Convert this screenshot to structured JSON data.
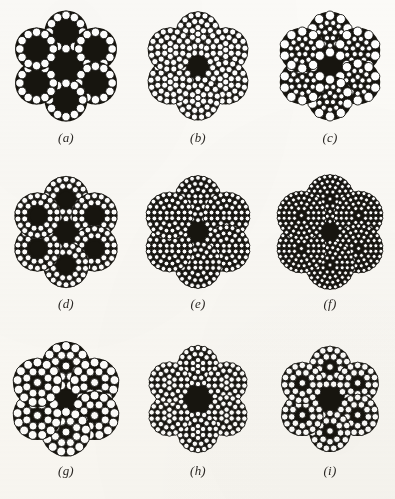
{
  "plate": {
    "background_color": "#fbfaf7",
    "ink_color": "#17150f",
    "wire_outline_color": "#141310",
    "wire_fill_color": "#ffffff",
    "columns": 3,
    "rows": 3,
    "width_px": 395,
    "height_px": 499
  },
  "figures": [
    {
      "id": "fig-a",
      "caption": "(a)",
      "description": "6 x 19 wire rope cross section with independent wire rope core; each strand is a single ring of 12 round wires around a dark core",
      "strand_count": 6,
      "strand_rings": [
        {
          "radius_ratio": 0.76,
          "wire_count": 12,
          "wire_radius": 4.2
        }
      ],
      "strand_core_dark": true,
      "strand_core_radius": 13.0,
      "strand_radius": 22.0,
      "orbit_radius": 34.0,
      "center_dark_radius": 22.0,
      "center_style": "round",
      "center_core_strand": {
        "rings": [
          {
            "radius_ratio": 0.0,
            "wire_count": 0,
            "wire_radius": 0
          }
        ]
      },
      "offset_x": 0,
      "offset_y": 0
    },
    {
      "id": "fig-b",
      "caption": "(b)",
      "description": "6 strand rope, each strand packed with many equal small wires, dark hexagonal core region",
      "strand_count": 6,
      "strand_rings": [
        {
          "radius_ratio": 0.84,
          "wire_count": 17,
          "wire_radius": 3.1
        },
        {
          "radius_ratio": 0.56,
          "wire_count": 12,
          "wire_radius": 3.1
        },
        {
          "radius_ratio": 0.28,
          "wire_count": 6,
          "wire_radius": 3.1
        },
        {
          "radius_ratio": 0.0,
          "wire_count": 1,
          "wire_radius": 3.1
        }
      ],
      "strand_core_dark": false,
      "strand_core_radius": 0,
      "strand_radius": 23.0,
      "orbit_radius": 32.0,
      "center_dark_radius": 26.0,
      "center_style": "hex",
      "offset_x": 0,
      "offset_y": 0
    },
    {
      "id": "fig-c",
      "caption": "(c)",
      "description": "6 strand Seale construction; large outer wires over smaller inner wires, dark star shaped core region",
      "strand_count": 6,
      "strand_rings": [
        {
          "radius_ratio": 0.8,
          "wire_count": 10,
          "wire_radius": 4.6
        },
        {
          "radius_ratio": 0.5,
          "wire_count": 11,
          "wire_radius": 2.6
        },
        {
          "radius_ratio": 0.22,
          "wire_count": 5,
          "wire_radius": 2.6
        }
      ],
      "strand_core_dark": false,
      "strand_core_radius": 0,
      "strand_radius": 23.0,
      "orbit_radius": 32.0,
      "center_dark_radius": 27.0,
      "center_style": "star",
      "offset_x": 0,
      "offset_y": 0
    },
    {
      "id": "fig-d",
      "caption": "(d)",
      "description": "6 strand rope, each strand has two concentric rings of wires around a dark strand core, dark center region",
      "strand_count": 6,
      "strand_rings": [
        {
          "radius_ratio": 0.84,
          "wire_count": 18,
          "wire_radius": 3.0
        },
        {
          "radius_ratio": 0.56,
          "wire_count": 12,
          "wire_radius": 3.0
        }
      ],
      "strand_core_dark": true,
      "strand_core_radius": 7.5,
      "strand_radius": 23.5,
      "orbit_radius": 33.0,
      "center_dark_radius": 23.0,
      "center_style": "round",
      "offset_x": 0,
      "offset_y": 0
    },
    {
      "id": "fig-e",
      "caption": "(e)",
      "description": "6 strand rope with very fine dense wires, large dark hexagonal core region",
      "strand_count": 6,
      "strand_rings": [
        {
          "radius_ratio": 0.88,
          "wire_count": 22,
          "wire_radius": 2.4
        },
        {
          "radius_ratio": 0.64,
          "wire_count": 16,
          "wire_radius": 2.4
        },
        {
          "radius_ratio": 0.4,
          "wire_count": 10,
          "wire_radius": 2.4
        },
        {
          "radius_ratio": 0.16,
          "wire_count": 4,
          "wire_radius": 2.4
        }
      ],
      "strand_core_dark": false,
      "strand_core_radius": 0,
      "strand_radius": 24.0,
      "orbit_radius": 33.0,
      "center_dark_radius": 29.0,
      "center_style": "hex",
      "offset_x": 0,
      "offset_y": 0
    },
    {
      "id": "fig-f",
      "caption": "(f)",
      "description": "6 strand rope with the finest wires of the plate, dark six point star core region",
      "strand_count": 6,
      "strand_rings": [
        {
          "radius_ratio": 0.9,
          "wire_count": 26,
          "wire_radius": 2.0
        },
        {
          "radius_ratio": 0.7,
          "wire_count": 20,
          "wire_radius": 2.0
        },
        {
          "radius_ratio": 0.5,
          "wire_count": 14,
          "wire_radius": 2.0
        },
        {
          "radius_ratio": 0.3,
          "wire_count": 8,
          "wire_radius": 2.0
        },
        {
          "radius_ratio": 0.0,
          "wire_count": 1,
          "wire_radius": 2.0
        }
      ],
      "strand_core_dark": false,
      "strand_core_radius": 0,
      "strand_radius": 25.0,
      "orbit_radius": 33.0,
      "center_dark_radius": 28.0,
      "center_style": "star",
      "offset_x": 0,
      "offset_y": 0
    },
    {
      "id": "fig-g",
      "caption": "(g)",
      "description": "6 strand rope with large round wires in each strand, dark star shaped core region",
      "strand_count": 6,
      "strand_rings": [
        {
          "radius_ratio": 0.8,
          "wire_count": 13,
          "wire_radius": 4.4
        },
        {
          "radius_ratio": 0.46,
          "wire_count": 8,
          "wire_radius": 4.0
        },
        {
          "radius_ratio": 0.0,
          "wire_count": 1,
          "wire_radius": 4.0
        }
      ],
      "strand_core_dark": false,
      "strand_core_radius": 0,
      "strand_radius": 25.0,
      "orbit_radius": 33.0,
      "center_dark_radius": 27.0,
      "center_style": "star",
      "offset_x": 0,
      "offset_y": 0
    },
    {
      "id": "fig-h",
      "caption": "(h)",
      "description": "6 strand rope, small dense wires, very large dark six point star core region",
      "strand_count": 6,
      "strand_rings": [
        {
          "radius_ratio": 0.86,
          "wire_count": 18,
          "wire_radius": 2.7
        },
        {
          "radius_ratio": 0.58,
          "wire_count": 12,
          "wire_radius": 2.7
        },
        {
          "radius_ratio": 0.28,
          "wire_count": 6,
          "wire_radius": 2.7
        },
        {
          "radius_ratio": 0.0,
          "wire_count": 1,
          "wire_radius": 2.7
        }
      ],
      "strand_core_dark": false,
      "strand_core_radius": 0,
      "strand_radius": 21.0,
      "orbit_radius": 33.0,
      "center_dark_radius": 30.0,
      "center_style": "star",
      "offset_x": 0,
      "offset_y": 0
    },
    {
      "id": "fig-i",
      "caption": "(i)",
      "description": "6 strand rope, medium wires, large dark six point star core region",
      "strand_count": 6,
      "strand_rings": [
        {
          "radius_ratio": 0.82,
          "wire_count": 15,
          "wire_radius": 3.3
        },
        {
          "radius_ratio": 0.5,
          "wire_count": 9,
          "wire_radius": 3.3
        },
        {
          "radius_ratio": 0.0,
          "wire_count": 1,
          "wire_radius": 3.3
        }
      ],
      "strand_core_dark": false,
      "strand_core_radius": 0,
      "strand_radius": 21.5,
      "orbit_radius": 32.0,
      "center_dark_radius": 29.0,
      "center_style": "star",
      "offset_x": 0,
      "offset_y": 0
    }
  ]
}
